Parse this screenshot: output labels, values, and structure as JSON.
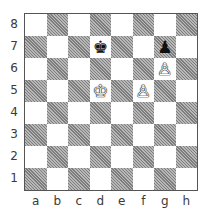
{
  "diagram": {
    "type": "chess-position",
    "files": [
      "a",
      "b",
      "c",
      "d",
      "e",
      "f",
      "g",
      "h"
    ],
    "ranks": [
      "8",
      "7",
      "6",
      "5",
      "4",
      "3",
      "2",
      "1"
    ],
    "colors": {
      "dark_square": "#9a9a9a",
      "light_square": "#ffffff",
      "border": "#555555"
    },
    "pieces": [
      {
        "square": "d7",
        "color": "black",
        "type": "king",
        "glyph": "♚"
      },
      {
        "square": "g7",
        "color": "black",
        "type": "pawn",
        "glyph": "♟"
      },
      {
        "square": "g6",
        "color": "white",
        "type": "pawn",
        "glyph": "♙"
      },
      {
        "square": "d5",
        "color": "white",
        "type": "king",
        "glyph": "♔"
      },
      {
        "square": "f5",
        "color": "white",
        "type": "pawn",
        "glyph": "♙"
      }
    ]
  }
}
